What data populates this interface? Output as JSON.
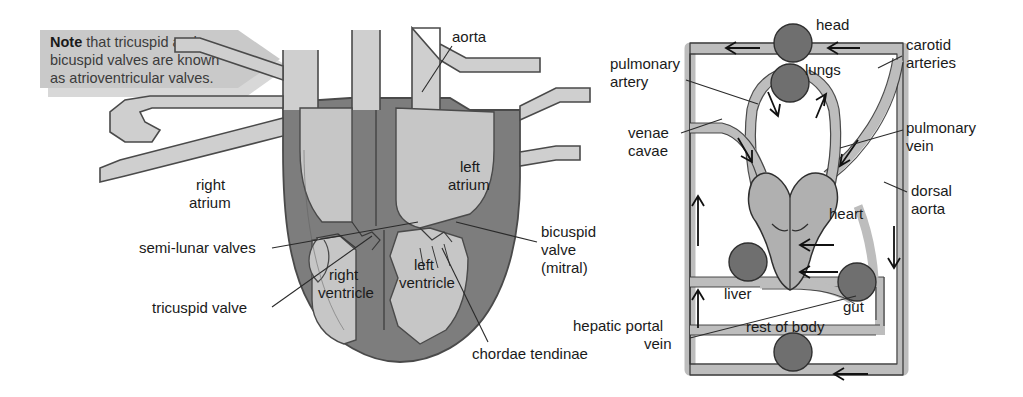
{
  "note_banner": {
    "bold_word": "Note",
    "text_rest": " that tricuspid and",
    "line2": "bicuspid valves are known",
    "line3": "as atrioventricular valves.",
    "background_color": "#c9c9c9",
    "shadow_color": "#d8d8d8"
  },
  "heart_diagram": {
    "labels": {
      "aorta": "aorta",
      "right_atrium_l1": "right",
      "right_atrium_l2": "atrium",
      "left_atrium_l1": "left",
      "left_atrium_l2": "atrium",
      "right_ventricle_l1": "right",
      "right_ventricle_l2": "ventricle",
      "left_ventricle_l1": "left",
      "left_ventricle_l2": "ventricle",
      "semi_lunar_valves": "semi-lunar valves",
      "tricuspid_valve": "tricuspid valve",
      "bicuspid_l1": "bicuspid",
      "bicuspid_l2": "valve",
      "bicuspid_l3": "(mitral)",
      "chordae_tendinae": "chordae tendinae"
    },
    "colors": {
      "muscle_wall": "#7d7d7d",
      "lumen": "#c6c6c6",
      "vessel_fill": "#cfcfcf",
      "outline": "#4a4a4a"
    }
  },
  "circulation_diagram": {
    "labels": {
      "head": "head",
      "lungs": "lungs",
      "heart": "heart",
      "liver": "liver",
      "gut": "gut",
      "rest_of_body": "rest of body",
      "pulmonary_artery_l1": "pulmonary",
      "pulmonary_artery_l2": "artery",
      "venae_cavae_l1": "venae",
      "venae_cavae_l2": "cavae",
      "carotid_arteries_l1": "carotid",
      "carotid_arteries_l2": "arteries",
      "pulmonary_vein_l1": "pulmonary",
      "pulmonary_vein_l2": "vein",
      "dorsal_aorta_l1": "dorsal",
      "dorsal_aorta_l2": "aorta",
      "hepatic_portal_vein_l1": "hepatic portal",
      "hepatic_portal_vein_l2": "vein"
    },
    "colors": {
      "vessel_fill": "#bdbdbd",
      "organ_fill": "#6f6f6f",
      "heart_fill": "#b0b0b0",
      "outline": "#2f2f2f"
    },
    "organ_nodes": [
      "head",
      "lungs",
      "liver",
      "gut",
      "rest of body"
    ],
    "flow_arrow_count": 11
  }
}
